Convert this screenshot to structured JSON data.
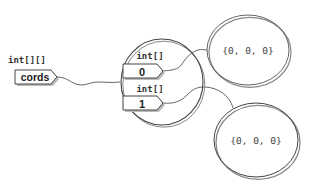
{
  "diagram": {
    "variable": {
      "type_label": "int[][]",
      "name": "cords"
    },
    "outer_array": {
      "slots": [
        {
          "type_label": "int[]",
          "index": "0"
        },
        {
          "type_label": "int[]",
          "index": "1"
        }
      ]
    },
    "inner_arrays": [
      {
        "contents": "{0, 0, 0}"
      },
      {
        "contents": "{0, 0, 0}"
      }
    ],
    "colors": {
      "stroke": "#555555",
      "text": "#222222",
      "box_fill": "#ffffff",
      "shadow": "#9a9a9a"
    }
  }
}
